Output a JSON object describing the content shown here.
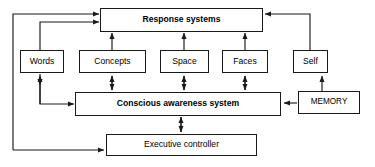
{
  "diagram": {
    "stroke_color": "#1a1a1a",
    "background_color": "#ffffff",
    "nodes": [
      {
        "id": "response",
        "label": "Response systems"
      },
      {
        "id": "words",
        "label": "Words"
      },
      {
        "id": "concepts",
        "label": "Concepts"
      },
      {
        "id": "space",
        "label": "Space"
      },
      {
        "id": "faces",
        "label": "Faces"
      },
      {
        "id": "self",
        "label": "Self"
      },
      {
        "id": "conscious",
        "label": "Conscious awareness system"
      },
      {
        "id": "memory",
        "label": "MEMORY"
      },
      {
        "id": "executive",
        "label": "Executive controller"
      }
    ],
    "edges": [
      {
        "from": "words",
        "to": "response",
        "arrow": "single"
      },
      {
        "from": "concepts",
        "to": "response",
        "arrow": "single"
      },
      {
        "from": "space",
        "to": "response",
        "arrow": "single"
      },
      {
        "from": "faces",
        "to": "response",
        "arrow": "single"
      },
      {
        "from": "self",
        "to": "response",
        "arrow": "single"
      },
      {
        "from": "conscious",
        "to": "words",
        "arrow": "single"
      },
      {
        "from": "conscious",
        "to": "concepts",
        "arrow": "double"
      },
      {
        "from": "conscious",
        "to": "space",
        "arrow": "double"
      },
      {
        "from": "conscious",
        "to": "faces",
        "arrow": "double"
      },
      {
        "from": "memory",
        "to": "self",
        "arrow": "single"
      },
      {
        "from": "memory",
        "to": "conscious",
        "arrow": "single"
      },
      {
        "from": "conscious",
        "to": "executive",
        "arrow": "double"
      },
      {
        "from": "executive",
        "to": "response",
        "arrow": "single"
      },
      {
        "from": "executive",
        "to": "conscious",
        "arrow": "single"
      }
    ]
  }
}
